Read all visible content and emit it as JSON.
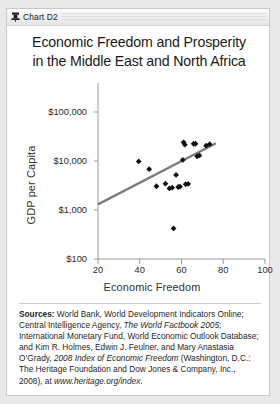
{
  "window": {
    "icon": "chart-thumbtack-icon",
    "label": "Chart D2"
  },
  "chart_title_line1": "Economic Freedom and Prosperity",
  "chart_title_line2": "in the Middle East and North Africa",
  "sources": {
    "heading": "Sources:",
    "part1": " World Bank, World Development Indicators Online; Central Intelligence Agency, ",
    "italic1": "The World Factbook 2005",
    "part2": "; International Monetary Fund, World Economic Outlook Database; and Kim R. Holmes, Edwin J. Feulner, and Mary Anastasia O’Grady, ",
    "italic2": "2008 Index of Economic Freedom",
    "part3": " (Washington, D.C.: The Heritage Foundation and Dow Jones & Company, Inc., 2008), at ",
    "italic3": "www.heritage.org/index",
    "part4": "."
  },
  "chart_data": {
    "type": "scatter",
    "title": "Economic Freedom and Prosperity in the Middle East and North Africa",
    "xlabel": "Economic Freedom",
    "ylabel": "GDP per Capita",
    "xlim": [
      20,
      100
    ],
    "ylim": [
      100,
      100000
    ],
    "yscale": "log",
    "grid": false,
    "legend": "none",
    "xticks": [
      20,
      40,
      60,
      80,
      100
    ],
    "xtick_labels": [
      "20",
      "40",
      "60",
      "80",
      "100"
    ],
    "yticks": [
      100,
      1000,
      10000,
      100000
    ],
    "ytick_labels": [
      "$100",
      "$1,000",
      "$10,000",
      "$100,000"
    ],
    "marker": "diamond",
    "marker_color": "#111111",
    "points": [
      {
        "x": 39.5,
        "y": 9800
      },
      {
        "x": 44.5,
        "y": 6800
      },
      {
        "x": 48.0,
        "y": 3050
      },
      {
        "x": 52.3,
        "y": 3450
      },
      {
        "x": 54.2,
        "y": 2750
      },
      {
        "x": 55.5,
        "y": 2850
      },
      {
        "x": 56.2,
        "y": 420
      },
      {
        "x": 57.4,
        "y": 5200
      },
      {
        "x": 58.4,
        "y": 2950
      },
      {
        "x": 59.3,
        "y": 3000
      },
      {
        "x": 60.6,
        "y": 10500
      },
      {
        "x": 61.0,
        "y": 24000
      },
      {
        "x": 61.6,
        "y": 21500
      },
      {
        "x": 62.0,
        "y": 3350
      },
      {
        "x": 63.2,
        "y": 3400
      },
      {
        "x": 65.8,
        "y": 22500
      },
      {
        "x": 66.7,
        "y": 22500
      },
      {
        "x": 67.5,
        "y": 12500
      },
      {
        "x": 68.6,
        "y": 13000
      },
      {
        "x": 71.8,
        "y": 20500
      },
      {
        "x": 73.5,
        "y": 22000
      }
    ],
    "trendline": {
      "label": "linear fit",
      "color": "#7d7d7d",
      "x_start": 20.0,
      "y_start": 1300,
      "x_end": 76.5,
      "y_end": 23000
    }
  }
}
